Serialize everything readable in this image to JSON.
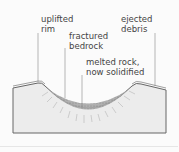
{
  "diagram": {
    "labels": [
      {
        "id": "uplifted-rim",
        "text": "uplifted\nrim"
      },
      {
        "id": "ejected-debris",
        "text": "ejected\ndebris"
      },
      {
        "id": "fractured-bedrock",
        "text": "fractured\nbedrock"
      },
      {
        "id": "melted-rock",
        "text": "melted rock,\nnow solidified"
      }
    ],
    "colors": {
      "ground": "#ececec",
      "outline": "#666666",
      "melt": "#9a9a9a",
      "leader": "#888888"
    }
  }
}
